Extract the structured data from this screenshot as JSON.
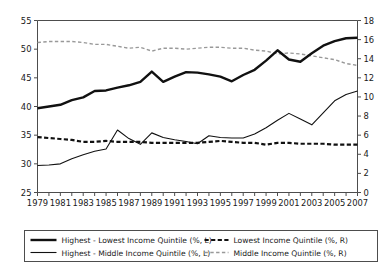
{
  "chart_data": {
    "type": "line",
    "title": "",
    "xlabel": "",
    "ylabel": "",
    "x": [
      1979,
      1980,
      1981,
      1982,
      1983,
      1984,
      1985,
      1986,
      1987,
      1988,
      1989,
      1990,
      1991,
      1992,
      1993,
      1994,
      1995,
      1996,
      1997,
      1998,
      1999,
      2000,
      2001,
      2002,
      2003,
      2004,
      2005,
      2006,
      2007
    ],
    "x_tick_labels": [
      "1979",
      "1981",
      "1983",
      "1985",
      "1987",
      "1989",
      "1991",
      "1993",
      "1995",
      "1997",
      "1999",
      "2001",
      "2003",
      "2005",
      "2007"
    ],
    "left_axis": {
      "label": "",
      "ylim": [
        25,
        55
      ],
      "ticks": [
        25,
        30,
        35,
        40,
        45,
        50,
        55
      ]
    },
    "right_axis": {
      "label": "",
      "ylim": [
        0,
        18
      ],
      "ticks": [
        0,
        2,
        4,
        6,
        8,
        10,
        12,
        14,
        16,
        18
      ]
    },
    "grid": false,
    "legend_position": "bottom",
    "series": [
      {
        "name": "Highest - Lowest Income Quintile (%, L)",
        "axis": "left",
        "style": "solid-thick",
        "color": "#111111",
        "width": 2.4,
        "values": [
          39.7,
          40.0,
          40.3,
          41.1,
          41.6,
          42.7,
          42.8,
          43.3,
          43.7,
          44.3,
          46.1,
          44.3,
          45.2,
          46.0,
          45.9,
          45.6,
          45.2,
          44.4,
          45.5,
          46.4,
          48.0,
          49.8,
          48.2,
          47.8,
          49.3,
          50.6,
          51.4,
          51.9,
          52.0
        ]
      },
      {
        "name": "Highest - Middle Income Quintile (%, L)",
        "axis": "left",
        "style": "solid-thin",
        "color": "#111111",
        "width": 1.1,
        "values": [
          29.7,
          29.8,
          30.0,
          30.9,
          31.6,
          32.2,
          32.6,
          35.9,
          34.4,
          33.4,
          35.4,
          34.6,
          34.2,
          33.9,
          33.5,
          34.9,
          34.6,
          34.5,
          34.5,
          35.2,
          36.3,
          37.6,
          38.8,
          37.8,
          36.8,
          38.9,
          41.0,
          42.1,
          42.7
        ]
      },
      {
        "name": "Lowest Income Quintile (%, R)",
        "axis": "right",
        "style": "dashed-thick",
        "color": "#111111",
        "width": 2.2,
        "values": [
          5.8,
          5.7,
          5.6,
          5.5,
          5.3,
          5.3,
          5.4,
          5.3,
          5.3,
          5.3,
          5.2,
          5.2,
          5.2,
          5.2,
          5.2,
          5.3,
          5.4,
          5.3,
          5.2,
          5.2,
          5.0,
          5.2,
          5.2,
          5.1,
          5.1,
          5.1,
          5.0,
          5.0,
          5.0
        ]
      },
      {
        "name": "Middle Income Quintile (%, R)",
        "axis": "right",
        "style": "dashed-thin",
        "color": "#999999",
        "width": 1.4,
        "values": [
          15.7,
          15.8,
          15.8,
          15.8,
          15.7,
          15.5,
          15.5,
          15.3,
          15.1,
          15.2,
          14.8,
          15.1,
          15.1,
          15.0,
          15.1,
          15.2,
          15.2,
          15.1,
          15.1,
          14.9,
          14.8,
          14.5,
          14.6,
          14.5,
          14.3,
          14.1,
          13.9,
          13.5,
          13.3
        ]
      }
    ]
  },
  "legend": {
    "entries": [
      {
        "label": "Highest - Lowest Income Quintile (%, L)"
      },
      {
        "label": "Highest - Middle Income Quintile (%, L)"
      },
      {
        "label": "Lowest Income Quintile (%, R)"
      },
      {
        "label": "Middle Income Quintile (%, R)"
      }
    ]
  }
}
